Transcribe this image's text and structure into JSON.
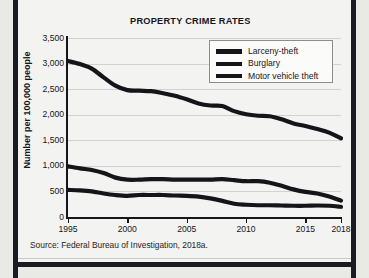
{
  "figure": {
    "source_note": "Source:  Federal Bureau of Investigation, 2018a.",
    "frame_color": "#1a1a22",
    "card_color": "#f3f3f1",
    "line_color": "#141419"
  },
  "chart_data": {
    "type": "line",
    "title": "PROPERTY CRIME RATES",
    "xlabel": "",
    "ylabel": "Number per 100,000 people",
    "xlim": [
      1995,
      2018
    ],
    "ylim": [
      0,
      3500
    ],
    "grid": true,
    "legend_position": "top-right",
    "xticks": [
      1995,
      2000,
      2005,
      2010,
      2015,
      2018
    ],
    "xtick_labels": [
      "1995",
      "2000",
      "2005",
      "2010",
      "2015",
      "2018"
    ],
    "yticks": [
      0,
      500,
      1000,
      1500,
      2000,
      2500,
      3000,
      3500
    ],
    "ytick_labels": [
      "0",
      "500",
      "1,000",
      "1,500",
      "2,000",
      "2,500",
      "3,000",
      "3,500"
    ],
    "x": [
      1995,
      1996,
      1997,
      1998,
      1999,
      2000,
      2001,
      2002,
      2003,
      2004,
      2005,
      2006,
      2007,
      2008,
      2009,
      2010,
      2011,
      2012,
      2013,
      2014,
      2015,
      2016,
      2017,
      2018
    ],
    "series": [
      {
        "name": "Larceny-theft",
        "color": "#141419",
        "values": [
          3050,
          2990,
          2900,
          2730,
          2570,
          2480,
          2470,
          2460,
          2420,
          2370,
          2300,
          2220,
          2180,
          2170,
          2070,
          2010,
          1980,
          1970,
          1910,
          1830,
          1780,
          1720,
          1650,
          1540
        ]
      },
      {
        "name": "Burglary",
        "color": "#141419",
        "values": [
          990,
          950,
          920,
          860,
          770,
          730,
          730,
          740,
          740,
          730,
          730,
          730,
          730,
          740,
          720,
          700,
          700,
          670,
          610,
          540,
          490,
          460,
          400,
          320
        ]
      },
      {
        "name": "Motor vehicle theft",
        "color": "#141419",
        "values": [
          530,
          520,
          500,
          460,
          430,
          415,
          430,
          430,
          430,
          420,
          415,
          400,
          365,
          315,
          260,
          240,
          230,
          230,
          225,
          220,
          220,
          225,
          220,
          200
        ]
      }
    ]
  }
}
